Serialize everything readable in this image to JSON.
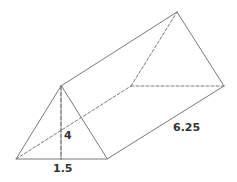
{
  "figure": {
    "type": "triangular-prism",
    "labels": {
      "height": "4",
      "base": "1.5",
      "length": "6.25"
    },
    "colors": {
      "stroke": "#7a7a7a",
      "text": "#333333",
      "background": "#ffffff"
    }
  }
}
